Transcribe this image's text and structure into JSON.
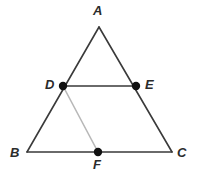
{
  "figure": {
    "background_color": "#ffffff",
    "width": 200,
    "height": 179,
    "stroke_dark": "#3a3a3a",
    "stroke_light": "#b8b8b8",
    "point_color": "#111111",
    "label_color": "#2b2b2b",
    "point_radius": 4.2,
    "stroke_width_main": 1.6,
    "stroke_width_light": 1.6
  },
  "points": [
    {
      "id": "A",
      "label": "A",
      "x": 99,
      "y": 27,
      "marked": false
    },
    {
      "id": "B",
      "label": "B",
      "x": 27,
      "y": 152,
      "marked": false
    },
    {
      "id": "C",
      "label": "C",
      "x": 172,
      "y": 152,
      "marked": false
    },
    {
      "id": "D",
      "label": "D",
      "x": 63,
      "y": 86,
      "marked": true
    },
    {
      "id": "E",
      "label": "E",
      "x": 136,
      "y": 86,
      "marked": true
    },
    {
      "id": "F",
      "label": "F",
      "x": 98,
      "y": 152,
      "marked": true
    }
  ],
  "segments": [
    {
      "id": "AB",
      "from": "A",
      "to": "B",
      "shade": "dark"
    },
    {
      "id": "AC",
      "from": "A",
      "to": "C",
      "shade": "dark"
    },
    {
      "id": "BC",
      "from": "B",
      "to": "C",
      "shade": "dark"
    },
    {
      "id": "DE",
      "from": "D",
      "to": "E",
      "shade": "dark"
    },
    {
      "id": "DF",
      "from": "D",
      "to": "F",
      "shade": "light"
    }
  ],
  "labels": {
    "A": "A",
    "B": "B",
    "C": "C",
    "D": "D",
    "E": "E",
    "F": "F"
  }
}
